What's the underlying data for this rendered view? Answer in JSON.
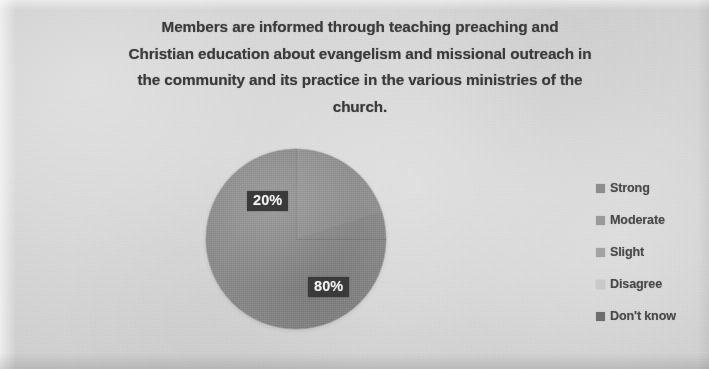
{
  "chart_data": {
    "type": "pie",
    "title": "Members are informed through teaching preaching and Christian education about evangelism and missional outreach in the community and its practice in the various ministries of the church.",
    "title_lines": [
      "Members are informed through teaching preaching and",
      "Christian education about evangelism and missional outreach in",
      "the community and its practice in the various ministries of the",
      "church."
    ],
    "categories": [
      "Strong",
      "Moderate",
      "Slight",
      "Disagree",
      "Don't know"
    ],
    "values": [
      20,
      80,
      0,
      0,
      0
    ],
    "value_labels": [
      "20%",
      "80%",
      "",
      "",
      ""
    ],
    "visible_data_labels": [
      "20%",
      "80%"
    ],
    "unit": "%",
    "legend_position": "right",
    "grid": false,
    "colors": [
      "#909090",
      "#8b8b8b",
      "#979797",
      "#c9c9c9",
      "#6f6f6f"
    ]
  },
  "chart": {
    "data_labels": [
      {
        "name": "slice-label-strong",
        "text": "20%"
      },
      {
        "name": "slice-label-moderate",
        "text": "80%"
      }
    ]
  },
  "legend": {
    "items": [
      {
        "label": "Strong",
        "color": "#8d8d8d"
      },
      {
        "label": "Moderate",
        "color": "#9a9a9a"
      },
      {
        "label": "Slight",
        "color": "#a3a3a3"
      },
      {
        "label": "Disagree",
        "color": "#c9c9c9"
      },
      {
        "label": "Don't know",
        "color": "#6d6d6d"
      }
    ]
  }
}
